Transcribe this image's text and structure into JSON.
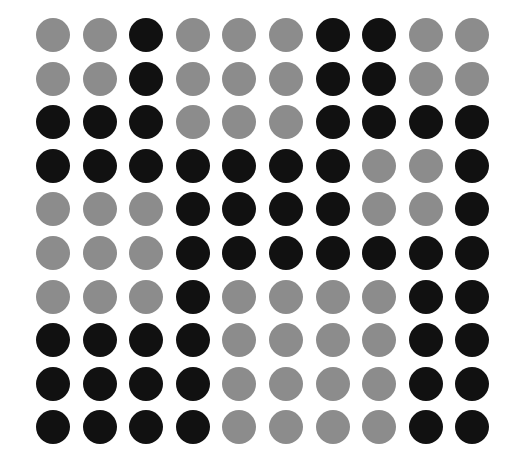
{
  "grid": {
    "rows": 10,
    "cols": 10,
    "origin": {
      "x": 53,
      "y": 35
    },
    "pitch": {
      "x": 46.6,
      "y": 43.6
    },
    "diameter": 34,
    "colors": {
      "B": "#111111",
      "G": "#8c8c8c"
    },
    "pattern": [
      "GGBGGGBBGG",
      "GGBGGGBBGG",
      "BBBGGGBBBB",
      "BBBBBBBGGB",
      "GGGBBBBGGB",
      "GGGBBBBBBB",
      "GGGBGGGGBB",
      "BBBBGGGGBB",
      "BBBBGGGGBB",
      "BBBBGGGGBB"
    ]
  }
}
